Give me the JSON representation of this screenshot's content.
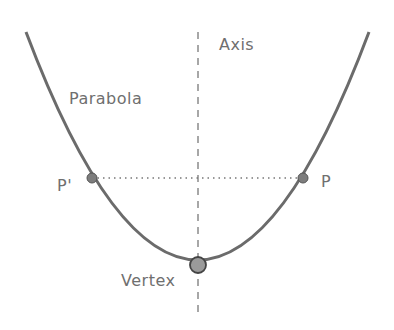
{
  "diagram": {
    "labels": {
      "axis": "Axis",
      "parabola": "Parabola",
      "p_prime": "P'",
      "p": "P",
      "vertex": "Vertex"
    },
    "colors": {
      "curve": "#6b6b6b",
      "axis_line": "#8a8a8a",
      "point_fill": "#7d7d7d",
      "vertex_fill": "#9a9a9a",
      "text": "#6f6f6f"
    },
    "points": {
      "vertex": [
        198,
        265
      ],
      "p_prime": [
        92,
        178
      ],
      "p": [
        303,
        178
      ]
    }
  }
}
